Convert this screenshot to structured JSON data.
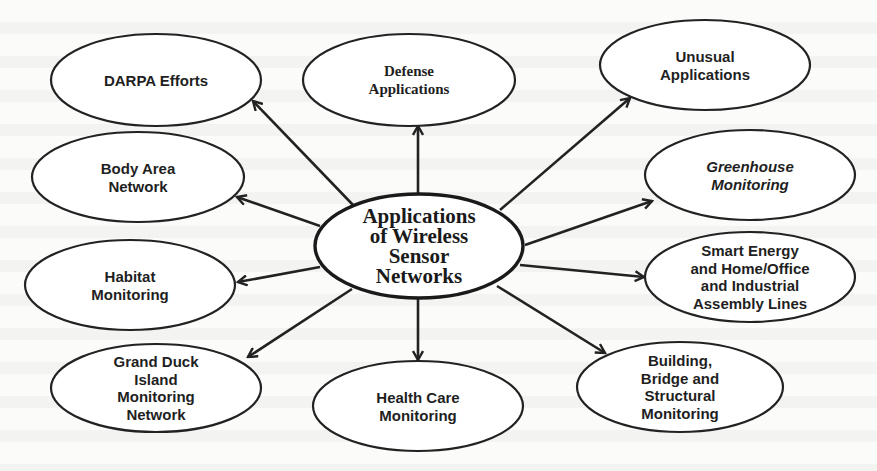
{
  "diagram": {
    "type": "mind-map",
    "center": {
      "id": "center",
      "lines": [
        "Applications",
        "of Wireless",
        "Sensor",
        "Networks"
      ],
      "cx": 419,
      "cy": 246,
      "rx": 104,
      "ry": 52
    },
    "nodes": [
      {
        "id": "darpa",
        "lines": [
          "DARPA Efforts"
        ],
        "cx": 156,
        "cy": 80,
        "rx": 105,
        "ry": 46,
        "style": "sans",
        "edge": {
          "x1": 354,
          "y1": 206,
          "x2": 253,
          "y2": 101
        }
      },
      {
        "id": "defense",
        "lines": [
          "Defense",
          "Applications"
        ],
        "cx": 409,
        "cy": 80,
        "rx": 106,
        "ry": 46,
        "style": "serif",
        "edge": {
          "x1": 418,
          "y1": 194,
          "x2": 418,
          "y2": 126
        }
      },
      {
        "id": "unusual",
        "lines": [
          "Unusual",
          "Applications"
        ],
        "cx": 705,
        "cy": 65,
        "rx": 105,
        "ry": 45,
        "style": "sans",
        "edge": {
          "x1": 500,
          "y1": 210,
          "x2": 630,
          "y2": 98
        }
      },
      {
        "id": "body-area",
        "lines": [
          "Body Area",
          "Network"
        ],
        "cx": 138,
        "cy": 177,
        "rx": 106,
        "ry": 45,
        "style": "sans",
        "edge": {
          "x1": 320,
          "y1": 226,
          "x2": 237,
          "y2": 197
        }
      },
      {
        "id": "greenhouse",
        "lines": [
          "Greenhouse",
          "Monitoring"
        ],
        "cx": 750,
        "cy": 175,
        "rx": 105,
        "ry": 45,
        "style": "sans-italic",
        "edge": {
          "x1": 525,
          "y1": 245,
          "x2": 652,
          "y2": 201
        }
      },
      {
        "id": "habitat",
        "lines": [
          "Habitat",
          "Monitoring"
        ],
        "cx": 130,
        "cy": 285,
        "rx": 105,
        "ry": 45,
        "style": "sans",
        "edge": {
          "x1": 320,
          "y1": 267,
          "x2": 238,
          "y2": 282
        }
      },
      {
        "id": "smart-energy",
        "lines": [
          "Smart Energy",
          "and Home/Office",
          "and Industrial",
          "Assembly Lines"
        ],
        "cx": 750,
        "cy": 277,
        "rx": 105,
        "ry": 45,
        "style": "sans",
        "edge": {
          "x1": 520,
          "y1": 265,
          "x2": 644,
          "y2": 277
        }
      },
      {
        "id": "grand-duck",
        "lines": [
          "Grand Duck",
          "Island",
          "Monitoring",
          "Network"
        ],
        "cx": 156,
        "cy": 388,
        "rx": 105,
        "ry": 44,
        "style": "sans",
        "edge": {
          "x1": 352,
          "y1": 289,
          "x2": 248,
          "y2": 357
        }
      },
      {
        "id": "health-care",
        "lines": [
          "Health Care",
          "Monitoring"
        ],
        "cx": 418,
        "cy": 406,
        "rx": 105,
        "ry": 45,
        "style": "sans",
        "edge": {
          "x1": 418,
          "y1": 298,
          "x2": 418,
          "y2": 360
        }
      },
      {
        "id": "building",
        "lines": [
          "Building,",
          "Bridge and",
          "Structural",
          "Monitoring"
        ],
        "cx": 680,
        "cy": 387,
        "rx": 103,
        "ry": 45,
        "style": "sans",
        "edge": {
          "x1": 497,
          "y1": 286,
          "x2": 605,
          "y2": 353
        }
      }
    ]
  },
  "colors": {
    "stroke": "#222222",
    "background": "#fbfbf9",
    "fill": "#ffffff"
  }
}
